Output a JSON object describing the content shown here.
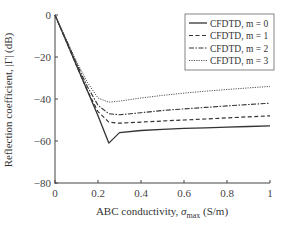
{
  "chart_data": {
    "type": "line",
    "title": "",
    "xlabel": "ABC conductivity, σmax (S/m)",
    "xlabel_parts": {
      "prefix": "ABC conductivity, ",
      "sym": "σ",
      "sub": "max",
      "suffix": " (S/m)"
    },
    "ylabel": "Reflection coefficient, |Γ| (dB)",
    "xlim": [
      0,
      1
    ],
    "ylim": [
      -80,
      0
    ],
    "xticks": [
      0,
      0.2,
      0.4,
      0.6,
      0.8,
      1
    ],
    "xtick_labels": [
      "0",
      "0.2",
      "0.4",
      "0.6",
      "0.8",
      "1"
    ],
    "yticks": [
      0,
      -20,
      -40,
      -60,
      -80
    ],
    "ytick_labels": [
      "0",
      "−20",
      "−40",
      "−60",
      "−80"
    ],
    "grid": false,
    "legend_position": "upper right",
    "series": [
      {
        "name": "CFDTD, m = 0",
        "style": "solid",
        "color": "#333333",
        "x": [
          0,
          0.05,
          0.1,
          0.15,
          0.2,
          0.25,
          0.3,
          0.4,
          0.5,
          0.6,
          0.7,
          0.8,
          0.9,
          1.0
        ],
        "y": [
          0,
          -12,
          -24,
          -36,
          -48,
          -61,
          -56,
          -55,
          -54.5,
          -54,
          -53.7,
          -53.4,
          -53.1,
          -52.8
        ]
      },
      {
        "name": "CFDTD, m = 1",
        "style": "dashed",
        "color": "#333333",
        "x": [
          0,
          0.05,
          0.1,
          0.15,
          0.2,
          0.25,
          0.3,
          0.4,
          0.5,
          0.6,
          0.7,
          0.8,
          0.9,
          1.0
        ],
        "y": [
          0,
          -12,
          -24,
          -36,
          -46,
          -51,
          -51.5,
          -51,
          -50.5,
          -50,
          -49.5,
          -49,
          -48.5,
          -48
        ]
      },
      {
        "name": "CFDTD, m = 2",
        "style": "dashdot",
        "color": "#333333",
        "x": [
          0,
          0.05,
          0.1,
          0.15,
          0.2,
          0.25,
          0.3,
          0.4,
          0.5,
          0.6,
          0.7,
          0.8,
          0.9,
          1.0
        ],
        "y": [
          0,
          -11.5,
          -23,
          -34,
          -43,
          -47,
          -47.5,
          -46.5,
          -45.5,
          -44.7,
          -44,
          -43.3,
          -42.6,
          -42
        ]
      },
      {
        "name": "CFDTD, m = 3",
        "style": "dotted",
        "color": "#555555",
        "x": [
          0,
          0.05,
          0.1,
          0.15,
          0.2,
          0.25,
          0.3,
          0.4,
          0.5,
          0.6,
          0.7,
          0.8,
          0.9,
          1.0
        ],
        "y": [
          0,
          -11,
          -22,
          -32,
          -39.5,
          -41.5,
          -41,
          -39.5,
          -38.3,
          -37.2,
          -36.3,
          -35.5,
          -34.7,
          -34
        ]
      }
    ]
  }
}
